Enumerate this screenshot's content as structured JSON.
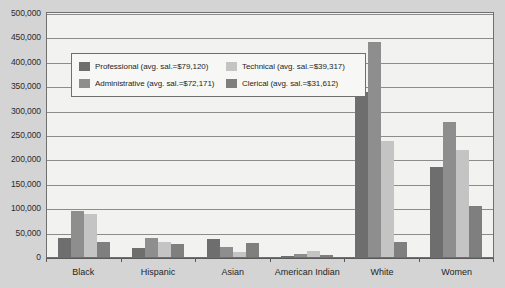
{
  "chart_data": {
    "type": "bar",
    "title": "",
    "xlabel": "",
    "ylabel": "",
    "ylim": [
      0,
      500000
    ],
    "grid": true,
    "legend_position": "inside-upper-left",
    "categories": [
      "Black",
      "Hispanic",
      "Asian",
      "American Indian",
      "White",
      "Women"
    ],
    "y_ticks": [
      "500,000",
      "450,000",
      "400,000",
      "350,000",
      "300,000",
      "250,000",
      "200,000",
      "150,000",
      "100,000",
      "50,000",
      "0"
    ],
    "y_tick_values": [
      500000,
      450000,
      400000,
      350000,
      300000,
      250000,
      200000,
      150000,
      100000,
      50000,
      0
    ],
    "series": [
      {
        "name": "Professional (avg. sal.=$79,120)",
        "short_name": "Professional",
        "avg_salary": "$79,120",
        "color": "#6e6e6e",
        "values": [
          38000,
          18000,
          37000,
          3000,
          338000,
          185000
        ]
      },
      {
        "name": "Administrative (avg. sal.=$72,171)",
        "short_name": "Administrative",
        "avg_salary": "$72,171",
        "color": "#8e8e8e",
        "values": [
          95000,
          38000,
          20000,
          6000,
          440000,
          277000
        ]
      },
      {
        "name": "Technical (avg. sal.=$39,317)",
        "short_name": "Technical",
        "avg_salary": "$39,317",
        "color": "#c4c4c4",
        "values": [
          88000,
          30000,
          10000,
          12000,
          238000,
          220000
        ]
      },
      {
        "name": "Clerical (avg. sal.=$31,612)",
        "short_name": "Clerical",
        "avg_salary": "$31,612",
        "color": "#7f7f7f",
        "values": [
          31000,
          27000,
          28000,
          4000,
          30000,
          105000
        ]
      }
    ]
  },
  "style": {
    "page_background": "#d4d4d4",
    "plot_background": "#f2f2f0",
    "legend_background": "#f7f7f5",
    "gridline_color": "#8c8c8c",
    "axis_color": "#6f6f6f",
    "text_color": "#1f1f1f"
  }
}
